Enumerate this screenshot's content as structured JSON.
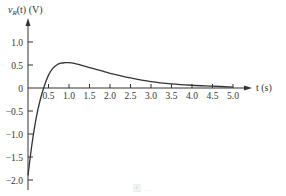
{
  "chart_data": {
    "type": "line",
    "title": "",
    "ylabel": "v_R(t) (V)",
    "xlabel": "t (s)",
    "xlim": [
      0,
      5.5
    ],
    "ylim": [
      -2.0,
      1.3
    ],
    "x_ticks": [
      0.5,
      1.0,
      1.5,
      2.0,
      2.5,
      3.0,
      3.5,
      4.0,
      4.5,
      5.0
    ],
    "x_tick_labels": [
      "0.5",
      "1.0",
      "1.5",
      "2.0",
      "2.5",
      "3.0",
      "3.5",
      "4.0",
      "4.5",
      "5.0"
    ],
    "y_ticks": [
      1.0,
      0.5,
      0,
      -0.5,
      -1.0,
      -1.5,
      -2.0
    ],
    "y_tick_labels": [
      "1.0",
      "0.5",
      "0",
      "-0.5",
      "-1.0",
      "-1.5",
      "-2.0"
    ],
    "grid": false,
    "legend": null,
    "series": [
      {
        "name": "v_R(t)",
        "x": [
          0,
          0.1,
          0.2,
          0.3,
          0.4,
          0.5,
          0.6,
          0.7,
          0.8,
          0.9,
          1.0,
          1.2,
          1.4,
          1.6,
          1.8,
          2.0,
          2.5,
          3.0,
          3.5,
          4.0,
          4.5,
          5.0
        ],
        "values": [
          -1.9,
          -1.2,
          -0.65,
          -0.25,
          0.05,
          0.28,
          0.42,
          0.5,
          0.54,
          0.55,
          0.55,
          0.52,
          0.47,
          0.42,
          0.37,
          0.32,
          0.22,
          0.14,
          0.09,
          0.06,
          0.04,
          0.02
        ]
      }
    ]
  },
  "labels": {
    "y_axis": "v",
    "y_axis_sub": "R",
    "y_axis_rest": "(t) (V)",
    "x_axis": "t (s)",
    "caption": "图 ... "
  }
}
